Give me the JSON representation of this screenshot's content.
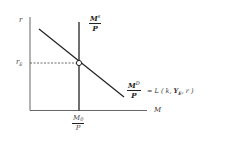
{
  "diagram": {
    "type": "money-market-equilibrium",
    "y_axis_label": "r",
    "x_axis_label": "M",
    "equilibrium_rate_label": "r",
    "equilibrium_rate_sub": "E",
    "supply_label": {
      "numerator": "M",
      "numerator_sup": "s",
      "denominator": "P"
    },
    "demand_label": {
      "numerator": "M",
      "numerator_sup": "D",
      "denominator": "P",
      "equation_prefix": "= L ( k, ",
      "equation_var": "Y",
      "equation_var_sub": "E",
      "equation_suffix": ", r )"
    },
    "money_stock_label": {
      "numerator": "M",
      "numerator_sub": "0",
      "denominator": "P"
    },
    "colors": {
      "line": "#222222",
      "axis": "#555555",
      "dashed": "#444444",
      "background": "#ffffff"
    }
  }
}
